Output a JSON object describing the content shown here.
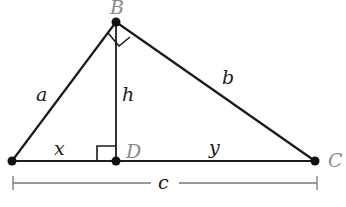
{
  "diagram": {
    "vertices": {
      "A": {
        "label": "",
        "x": 12,
        "y": 161
      },
      "B": {
        "label": "B",
        "x": 116,
        "y": 22
      },
      "C": {
        "label": "C",
        "x": 315,
        "y": 161
      },
      "D": {
        "label": "D",
        "x": 116,
        "y": 161
      }
    },
    "segments": {
      "a": {
        "label": "a",
        "from": "A",
        "to": "B"
      },
      "b": {
        "label": "b",
        "from": "B",
        "to": "C"
      },
      "h": {
        "label": "h",
        "from": "B",
        "to": "D"
      },
      "x": {
        "label": "x",
        "from": "A",
        "to": "D"
      },
      "y": {
        "label": "y",
        "from": "D",
        "to": "C"
      }
    },
    "dimension": {
      "label": "c",
      "from_x": 13,
      "to_x": 317,
      "y": 183
    },
    "right_angles": [
      "B",
      "D"
    ],
    "colors": {
      "line": "#1a1a1a",
      "vertex_label": "#8a8a8a",
      "dimension_line": "#777777"
    }
  }
}
